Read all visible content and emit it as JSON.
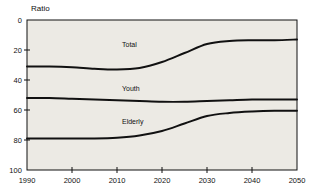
{
  "chart_data": {
    "type": "line",
    "title": "Ratio",
    "xlabel": "",
    "ylabel": "Ratio",
    "xlim": [
      1990,
      2050
    ],
    "ylim": [
      0,
      100
    ],
    "grid": false,
    "legend_position": "inline-labels",
    "background": "#eceae4",
    "line_color": "#111111",
    "xticks": [
      1990,
      2000,
      2010,
      2020,
      2030,
      2040,
      2050
    ],
    "yticks": [
      0,
      20,
      40,
      60,
      80,
      100
    ],
    "x": [
      1990,
      1995,
      2000,
      2005,
      2010,
      2015,
      2020,
      2025,
      2030,
      2035,
      2040,
      2045,
      2050
    ],
    "series": [
      {
        "name": "Total",
        "values": [
          69,
          69,
          68.5,
          67.5,
          67,
          68,
          72,
          78,
          84,
          86,
          86.5,
          86.5,
          87
        ]
      },
      {
        "name": "Youth",
        "values": [
          48,
          48,
          47.5,
          47,
          46.5,
          46,
          45.5,
          45.5,
          46,
          46.5,
          47,
          47,
          47
        ]
      },
      {
        "name": "Elderly",
        "values": [
          21,
          21,
          21,
          21,
          21.5,
          23,
          26,
          31,
          36,
          38,
          39,
          39.5,
          39.5
        ]
      }
    ]
  },
  "annotations": {
    "total_label": "Total",
    "youth_label": "Youth",
    "elderly_label": "Elderly"
  },
  "axes": {
    "y_tick_labels": [
      "100",
      "80",
      "60",
      "40",
      "20",
      "0"
    ],
    "x_tick_labels": [
      "1990",
      "2000",
      "2010",
      "2020",
      "2030",
      "2040",
      "2050"
    ],
    "y_axis_title": "Ratio"
  }
}
